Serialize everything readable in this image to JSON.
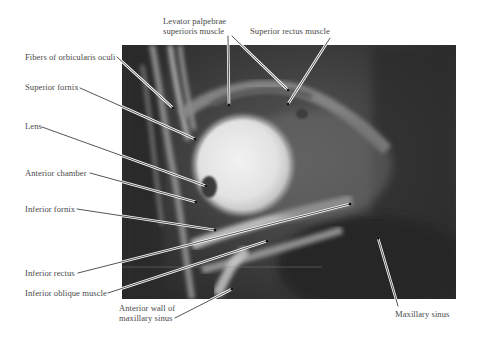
{
  "figure": {
    "labels": [
      {
        "id": "levator",
        "text": "Levator palpebrae\nsuperioris muscle"
      },
      {
        "id": "superior_rectus",
        "text": "Superior rectus muscle"
      },
      {
        "id": "orbicularis",
        "text": "Fibers of orbicularis oculi"
      },
      {
        "id": "superior_fornix",
        "text": "Superior fornix"
      },
      {
        "id": "lens",
        "text": "Lens"
      },
      {
        "id": "anterior_chamber",
        "text": "Anterior chamber"
      },
      {
        "id": "inferior_fornix",
        "text": "Inferior fornix"
      },
      {
        "id": "inferior_rectus",
        "text": "Inferior rectus"
      },
      {
        "id": "inferior_oblique",
        "text": "Inferior oblique muscle"
      },
      {
        "id": "anterior_wall",
        "text": "Anterior wall of\nmaxillary sinus"
      },
      {
        "id": "maxillary_sinus",
        "text": "Maxillary sinus"
      }
    ]
  },
  "colors": {
    "background": "#ffffff",
    "label_text": "#4a4a4a",
    "leader_line": "#2a2a2a",
    "mri_dark": "#2f2f2f",
    "globe": "#e6e6e6"
  }
}
